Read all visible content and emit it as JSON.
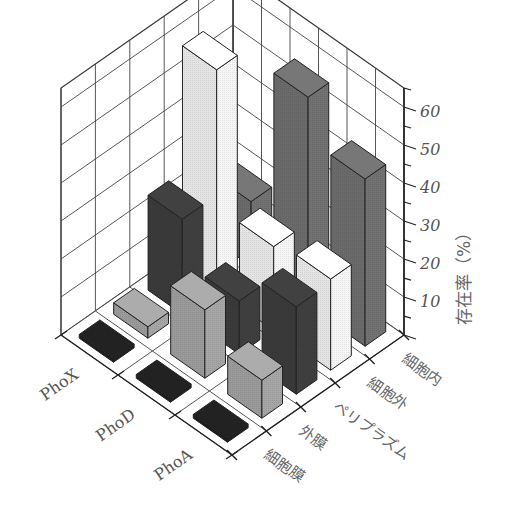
{
  "chart_data": {
    "type": "bar3d",
    "title": "",
    "zlabel": "存在率（%）",
    "zlim": [
      0,
      65
    ],
    "zticks": [
      10,
      20,
      30,
      40,
      50,
      60
    ],
    "columns": [
      "PhoX",
      "PhoD",
      "PhoA"
    ],
    "rows": [
      "細胞膜",
      "外膜",
      "ペリプラズム",
      "細胞外",
      "細胞内"
    ],
    "row_colors": {
      "細胞膜": "#1e1e1e",
      "外膜": "#9a9a9a",
      "ペリプラズム": "#3a3a3a",
      "細胞外": "#e4e4e4",
      "細胞内": "#6a6a6a"
    },
    "series": [
      {
        "name": "PhoX",
        "values": {
          "細胞膜": 1,
          "外膜": 3,
          "ペリプラズム": 25,
          "細胞外": 58,
          "細胞内": 17
        }
      },
      {
        "name": "PhoD",
        "values": {
          "細胞膜": 1,
          "外膜": 18,
          "ペリプラズム": 14,
          "細胞外": 22,
          "細胞内": 55
        }
      },
      {
        "name": "PhoA",
        "values": {
          "細胞膜": 1,
          "外膜": 10,
          "ペリプラズム": 23,
          "細胞外": 24,
          "細胞内": 44
        }
      }
    ],
    "grid": true,
    "legend": "none"
  },
  "axis": {
    "z_title": "存在率（%）",
    "z_tick_labels": [
      "10",
      "20",
      "30",
      "40",
      "50",
      "60"
    ],
    "column_labels": [
      "PhoX",
      "PhoD",
      "PhoA"
    ],
    "row_labels": [
      "細胞膜",
      "外膜",
      "ペリプラズム",
      "細胞外",
      "細胞内"
    ]
  }
}
